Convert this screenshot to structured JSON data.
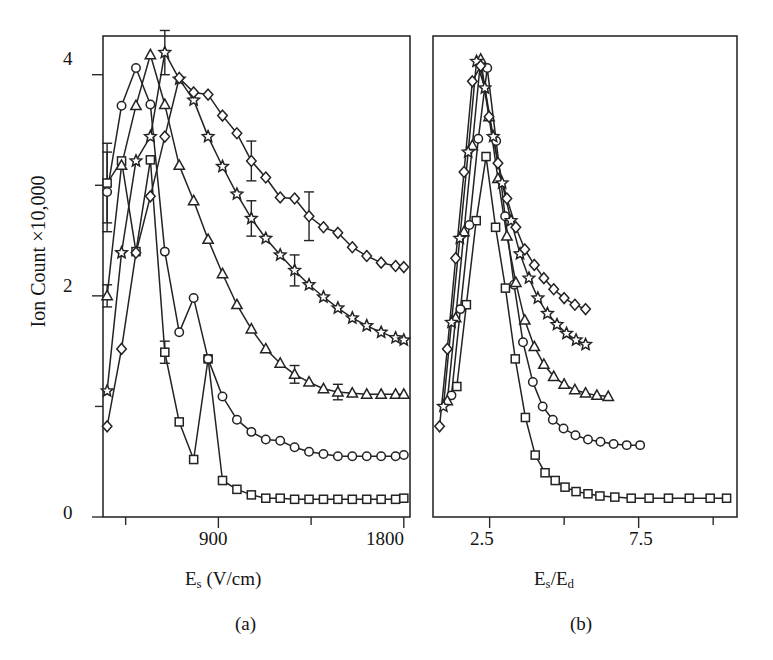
{
  "figure": {
    "ylabel": "Ion Count ×10,000",
    "background": "#ffffff",
    "ink_color": "#232323"
  },
  "panel_a": {
    "caption": "(a)",
    "xlabel_main": "E",
    "xlabel_sub": "s",
    "xlabel_unit": " (V/cm)",
    "xlabel_full": "Es (V/cm)",
    "xticks": [
      "900",
      "1800"
    ],
    "yticks": [
      "0",
      "2",
      "4"
    ]
  },
  "panel_b": {
    "caption": "(b)",
    "xlabel_num": "E",
    "xlabel_num_sub": "s",
    "xlabel_den": "E",
    "xlabel_den_sub": "d",
    "xlabel_full": "Es/Ed",
    "xticks": [
      "2.5",
      "7.5"
    ]
  },
  "chart_data": {
    "type": "line",
    "title": "",
    "panels": [
      {
        "id": "a",
        "xlabel": "Es (V/cm)",
        "ylabel": "Ion Count ×10,000",
        "xlim": [
          340,
          1830
        ],
        "ylim": [
          0,
          4.35
        ],
        "xticks_major": [
          900,
          1800
        ],
        "xticks_minor": [
          450,
          1350
        ],
        "yticks_major": [
          0,
          2,
          4
        ],
        "yticks_minor": [
          1,
          3
        ],
        "grid": false,
        "legend": "none",
        "series": [
          {
            "name": "square",
            "marker": "square",
            "x": [
              360,
              430,
              500,
              570,
              640,
              710,
              780,
              850,
              920,
              990,
              1060,
              1130,
              1200,
              1270,
              1340,
              1410,
              1480,
              1550,
              1620,
              1690,
              1760,
              1800
            ],
            "y": [
              3.02,
              3.22,
              2.4,
              3.23,
              1.49,
              0.86,
              0.52,
              1.43,
              0.33,
              0.25,
              0.2,
              0.17,
              0.17,
              0.16,
              0.16,
              0.16,
              0.16,
              0.16,
              0.16,
              0.16,
              0.16,
              0.17
            ]
          },
          {
            "name": "circle",
            "marker": "circle",
            "x": [
              360,
              430,
              500,
              570,
              640,
              710,
              780,
              850,
              920,
              990,
              1060,
              1130,
              1200,
              1270,
              1340,
              1410,
              1480,
              1550,
              1620,
              1690,
              1760,
              1800
            ],
            "y": [
              2.94,
              3.72,
              4.06,
              3.73,
              2.4,
              1.67,
              1.98,
              1.43,
              1.09,
              0.88,
              0.77,
              0.7,
              0.69,
              0.63,
              0.59,
              0.57,
              0.55,
              0.55,
              0.55,
              0.55,
              0.55,
              0.56
            ]
          },
          {
            "name": "triangle",
            "marker": "triangle",
            "x": [
              360,
              430,
              500,
              570,
              640,
              710,
              780,
              850,
              920,
              990,
              1060,
              1130,
              1200,
              1270,
              1340,
              1410,
              1480,
              1550,
              1620,
              1690,
              1760,
              1800
            ],
            "y": [
              2.0,
              3.18,
              3.72,
              4.18,
              3.73,
              3.18,
              2.86,
              2.51,
              2.2,
              1.92,
              1.7,
              1.52,
              1.39,
              1.29,
              1.22,
              1.16,
              1.13,
              1.12,
              1.11,
              1.11,
              1.11,
              1.11
            ]
          },
          {
            "name": "star",
            "marker": "star",
            "x": [
              360,
              430,
              500,
              570,
              640,
              710,
              780,
              850,
              920,
              990,
              1060,
              1130,
              1200,
              1270,
              1340,
              1410,
              1480,
              1550,
              1620,
              1690,
              1760,
              1800
            ],
            "y": [
              1.14,
              2.39,
              3.22,
              3.44,
              4.2,
              3.96,
              3.77,
              3.44,
              3.17,
              2.92,
              2.7,
              2.52,
              2.37,
              2.23,
              2.1,
              1.99,
              1.89,
              1.8,
              1.73,
              1.67,
              1.62,
              1.6
            ]
          },
          {
            "name": "diamond",
            "marker": "diamond",
            "x": [
              360,
              430,
              500,
              570,
              640,
              710,
              780,
              850,
              920,
              990,
              1060,
              1130,
              1200,
              1270,
              1340,
              1410,
              1480,
              1550,
              1620,
              1690,
              1760,
              1800
            ],
            "y": [
              0.82,
              1.52,
              2.39,
              2.9,
              3.44,
              3.97,
              3.84,
              3.82,
              3.63,
              3.47,
              3.22,
              3.07,
              2.89,
              2.88,
              2.72,
              2.62,
              2.57,
              2.44,
              2.36,
              2.3,
              2.27,
              2.26
            ]
          }
        ],
        "errorbars": [
          {
            "series": "square",
            "x": 360,
            "y": 3.02,
            "err": 0.36
          },
          {
            "series": "circle",
            "x": 360,
            "y": 2.94,
            "err": 0.36
          },
          {
            "series": "triangle",
            "x": 360,
            "y": 2.0,
            "err": 0.1
          },
          {
            "series": "star",
            "x": 640,
            "y": 4.2,
            "err": 0.2
          },
          {
            "series": "square",
            "x": 640,
            "y": 1.49,
            "err": 0.1
          },
          {
            "series": "diamond",
            "x": 1060,
            "y": 3.22,
            "err": 0.18
          },
          {
            "series": "diamond",
            "x": 1340,
            "y": 2.72,
            "err": 0.22
          },
          {
            "series": "star",
            "x": 1060,
            "y": 2.7,
            "err": 0.16
          },
          {
            "series": "star",
            "x": 1270,
            "y": 2.23,
            "err": 0.14
          },
          {
            "series": "triangle",
            "x": 1270,
            "y": 1.29,
            "err": 0.08
          },
          {
            "series": "triangle",
            "x": 1480,
            "y": 1.13,
            "err": 0.07
          }
        ]
      },
      {
        "id": "b",
        "xlabel": "Es/Ed",
        "ylabel": "Ion Count ×10,000",
        "xlim": [
          0.6,
          10.8
        ],
        "ylim": [
          0,
          4.35
        ],
        "xticks_major": [
          2.5,
          7.5
        ],
        "xticks_minor": [
          5.0,
          10.0
        ],
        "yticks_major": [
          0,
          2,
          4
        ],
        "grid": false,
        "legend": "none",
        "series": [
          {
            "name": "square",
            "marker": "square",
            "x": [
              1.4,
              1.72,
              2.05,
              2.38,
              2.7,
              3.03,
              3.36,
              3.7,
              4.03,
              4.36,
              4.7,
              5.03,
              5.4,
              5.8,
              6.2,
              6.7,
              7.25,
              7.85,
              8.5,
              9.2,
              9.9,
              10.45
            ],
            "y": [
              1.18,
              1.92,
              2.68,
              3.26,
              2.62,
              2.07,
              1.43,
              0.9,
              0.56,
              0.4,
              0.33,
              0.27,
              0.23,
              0.21,
              0.19,
              0.18,
              0.17,
              0.17,
              0.17,
              0.17,
              0.17,
              0.17
            ]
          },
          {
            "name": "circle",
            "marker": "circle",
            "x": [
              1.22,
              1.52,
              1.82,
              2.12,
              2.42,
              2.72,
              3.02,
              3.32,
              3.62,
              3.95,
              4.28,
              4.62,
              4.98,
              5.38,
              5.8,
              6.22,
              6.66,
              7.1,
              7.55
            ],
            "y": [
              1.1,
              1.88,
              2.64,
              3.42,
              4.06,
              3.4,
              2.72,
              2.1,
              1.58,
              1.22,
              1.0,
              0.88,
              0.8,
              0.74,
              0.7,
              0.68,
              0.66,
              0.65,
              0.65
            ]
          },
          {
            "name": "triangle",
            "marker": "triangle",
            "x": [
              1.08,
              1.36,
              1.64,
              1.92,
              2.2,
              2.48,
              2.78,
              3.08,
              3.38,
              3.68,
              4.0,
              4.32,
              4.65,
              5.0,
              5.36,
              5.72,
              6.1,
              6.48
            ],
            "y": [
              1.05,
              1.8,
              2.58,
              3.36,
              4.14,
              3.62,
              3.06,
              2.54,
              2.12,
              1.78,
              1.54,
              1.38,
              1.27,
              1.2,
              1.15,
              1.12,
              1.1,
              1.09
            ]
          },
          {
            "name": "star",
            "marker": "star",
            "x": [
              0.95,
              1.22,
              1.5,
              1.78,
              2.06,
              2.34,
              2.62,
              2.92,
              3.22,
              3.52,
              3.82,
              4.12,
              4.44,
              4.76,
              5.08,
              5.4,
              5.72
            ],
            "y": [
              1.0,
              1.76,
              2.52,
              3.3,
              4.12,
              3.88,
              3.44,
              3.02,
              2.68,
              2.38,
              2.16,
              1.98,
              1.84,
              1.74,
              1.66,
              1.6,
              1.56
            ]
          },
          {
            "name": "diamond",
            "marker": "diamond",
            "x": [
              0.82,
              1.08,
              1.36,
              1.64,
              1.92,
              2.2,
              2.48,
              2.78,
              3.08,
              3.38,
              3.68,
              4.0,
              4.32,
              4.65,
              5.0,
              5.36,
              5.72
            ],
            "y": [
              0.82,
              1.52,
              2.34,
              3.12,
              3.94,
              4.08,
              3.62,
              3.2,
              2.88,
              2.62,
              2.42,
              2.28,
              2.16,
              2.06,
              1.98,
              1.92,
              1.88
            ]
          }
        ],
        "errorbars": []
      }
    ]
  }
}
